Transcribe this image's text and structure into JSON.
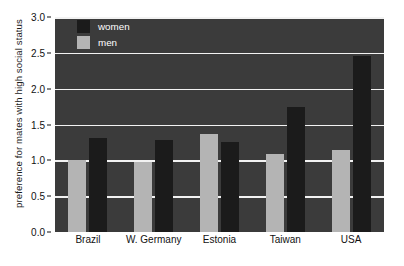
{
  "chart_data": {
    "type": "bar",
    "title": "",
    "xlabel": "",
    "ylabel": "preference for  mates with high social status",
    "categories": [
      "Brazil",
      "W. Germany",
      "Estonia",
      "Taiwan",
      "USA"
    ],
    "series": [
      {
        "name": "women",
        "color": "#1b1b1b",
        "values": [
          1.31,
          1.28,
          1.25,
          1.75,
          2.45
        ]
      },
      {
        "name": "men",
        "color": "#b4b4b4",
        "values": [
          1.0,
          0.97,
          1.37,
          1.09,
          1.14
        ]
      }
    ],
    "series_order_in_plot": [
      "men",
      "women"
    ],
    "ylim": [
      0.0,
      3.0
    ],
    "ytick_labels": [
      "0.0",
      "0.5",
      "1.0",
      "1.5",
      "2.0",
      "2.5",
      "3.0"
    ],
    "ytick_values": [
      0.0,
      0.5,
      1.0,
      1.5,
      2.0,
      2.5,
      3.0
    ],
    "grid": true,
    "grid_color": "#f2f2f2",
    "plot_background": "#3b3b3b",
    "legend_position": "top-left-inside",
    "legend_entries": [
      "women",
      "men"
    ]
  },
  "caption": {
    "text": ""
  }
}
